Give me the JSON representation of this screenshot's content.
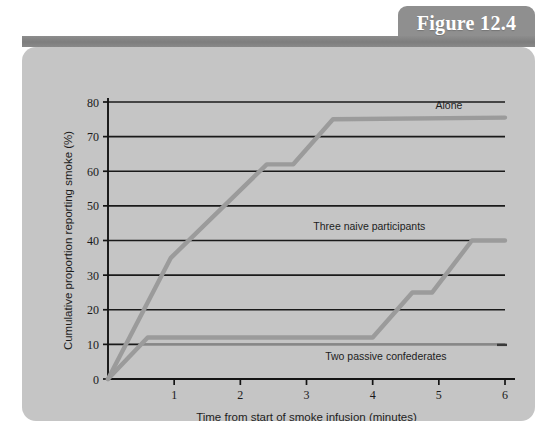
{
  "figure": {
    "tab_label": "Figure 12.4",
    "panel_color": "#c5c5c5",
    "bar_color": "#838383",
    "tab_color": "#8f8f8f",
    "line_color": "#9b9b9b",
    "grid_color": "#1a1a1a"
  },
  "chart_data": {
    "type": "line",
    "title": "",
    "xlabel": "Time from start of smoke infusion (minutes)",
    "ylabel": "Cumulative proportion reporting smoke (%)",
    "xlim": [
      0,
      6
    ],
    "ylim": [
      0,
      80
    ],
    "xticks": [
      "0",
      "1",
      "2",
      "3",
      "4",
      "5",
      "6"
    ],
    "yticks": [
      "0",
      "10",
      "20",
      "30",
      "40",
      "50",
      "60",
      "70",
      "80"
    ],
    "grid": "horizontal",
    "legend_position": "inline-labels",
    "series": [
      {
        "name": "Alone",
        "label": "Alone",
        "label_x": 4.95,
        "label_y": 78,
        "points": [
          [
            0.0,
            0
          ],
          [
            0.95,
            35
          ],
          [
            2.4,
            62
          ],
          [
            2.8,
            62
          ],
          [
            3.4,
            75
          ],
          [
            6.0,
            75.5
          ]
        ]
      },
      {
        "name": "Three naive participants",
        "label": "Three naive participants",
        "label_x": 3.95,
        "label_y": 43,
        "points": [
          [
            0.0,
            0
          ],
          [
            0.6,
            12
          ],
          [
            4.0,
            12
          ],
          [
            4.6,
            25
          ],
          [
            4.9,
            25
          ],
          [
            5.5,
            40
          ],
          [
            6.0,
            40
          ]
        ]
      },
      {
        "name": "Two passive confederates",
        "label": "Two passive confederates",
        "label_x": 4.2,
        "label_y": 5.5,
        "points": [
          [
            0.0,
            0
          ],
          [
            0.5,
            10
          ],
          [
            6.0,
            10
          ]
        ]
      }
    ]
  }
}
